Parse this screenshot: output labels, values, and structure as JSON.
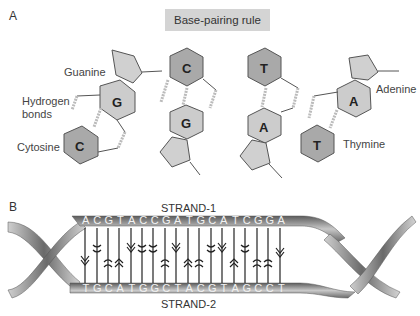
{
  "panel_a": {
    "label": "A",
    "title": "Base-pairing rule",
    "labels": {
      "guanine": "Guanine",
      "hydrogen_bonds_1": "Hydrogen",
      "hydrogen_bonds_2": "bonds",
      "cytosine": "Cytosine",
      "adenine": "Adenine",
      "thymine": "Thymine"
    },
    "pairs": [
      {
        "top": "G",
        "bottom": "C"
      },
      {
        "top": "C",
        "bottom": "G"
      },
      {
        "top": "T",
        "bottom": "A"
      },
      {
        "top": "A",
        "bottom": "T"
      }
    ]
  },
  "panel_b": {
    "label": "B",
    "strand1_name": "STRAND-1",
    "strand2_name": "STRAND-2",
    "strand1": [
      "A",
      "C",
      "G",
      "T",
      "A",
      "C",
      "C",
      "G",
      "A",
      "T",
      "G",
      "C",
      "A",
      "T",
      "C",
      "G",
      "G",
      "A"
    ],
    "strand2": [
      "T",
      "G",
      "C",
      "A",
      "T",
      "G",
      "G",
      "C",
      "T",
      "A",
      "C",
      "G",
      "T",
      "A",
      "G",
      "C",
      "C",
      "T"
    ]
  },
  "colors": {
    "base_fill": "#c8c8c8",
    "base_dark": "#a8a8a8",
    "base_edge": "#555555",
    "title_bg": "#d4d4d4",
    "ribbon": "#8a8a8a"
  }
}
